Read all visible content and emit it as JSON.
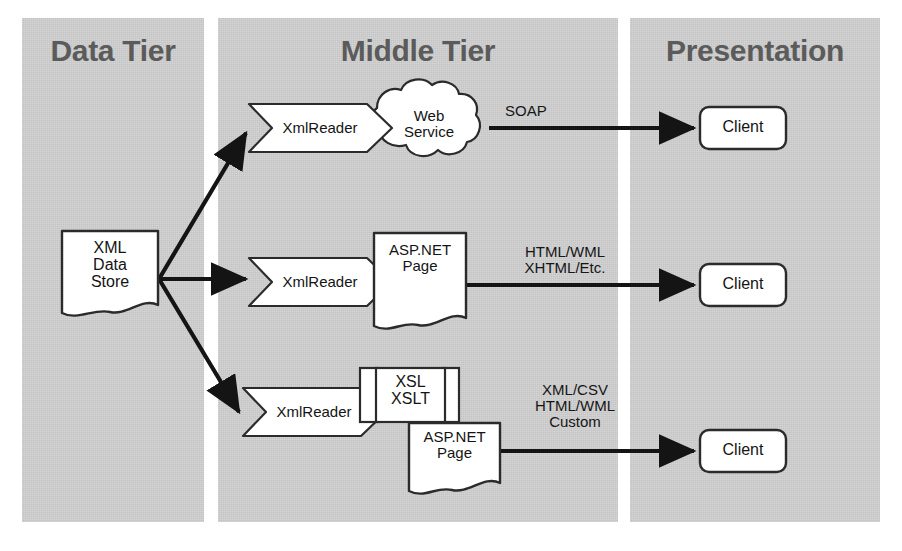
{
  "diagram": {
    "colors": {
      "panel_fill": "#c4c4c4",
      "panel_title_text": "#5b5b5b",
      "shape_fill": "#ffffff",
      "shape_stroke": "#2b2b2b",
      "arrow": "#141414",
      "page_background": "#ffffff"
    }
  },
  "tiers": [
    {
      "id": "data",
      "title": "Data Tier"
    },
    {
      "id": "middle",
      "title": "Middle Tier"
    },
    {
      "id": "presentation",
      "title": "Presentation"
    }
  ],
  "nodes": {
    "data_store": {
      "label": "XML\nData\nStore",
      "shape": "document"
    },
    "readers": [
      {
        "id": "reader-top",
        "label": "XmlReader",
        "shape": "hexagon-notched"
      },
      {
        "id": "reader-middle",
        "label": "XmlReader",
        "shape": "hexagon-notched"
      },
      {
        "id": "reader-bottom",
        "label": "XmlReader",
        "shape": "hexagon-notched"
      }
    ],
    "web_service": {
      "label": "Web\nService",
      "shape": "cloud"
    },
    "aspnet_page_top": {
      "label": "ASP.NET\nPage",
      "shape": "document"
    },
    "xsl_stack": {
      "label": "XSL\nXSLT",
      "shape": "multi-document"
    },
    "aspnet_page_bottom": {
      "label": "ASP.NET\nPage",
      "shape": "document"
    },
    "clients": [
      {
        "id": "client-top",
        "label": "Client",
        "shape": "rounded-rect"
      },
      {
        "id": "client-middle",
        "label": "Client",
        "shape": "rounded-rect"
      },
      {
        "id": "client-bottom",
        "label": "Client",
        "shape": "rounded-rect"
      }
    ]
  },
  "edge_labels": {
    "soap": "SOAP",
    "html_wml": "HTML/WML\nXHTML/Etc.",
    "xml_csv": "XML/CSV\nHTML/WML\nCustom"
  },
  "flows": [
    {
      "from": "XML Data Store",
      "to": "XmlReader (top)",
      "label": ""
    },
    {
      "from": "XML Data Store",
      "to": "XmlReader (middle)",
      "label": ""
    },
    {
      "from": "XML Data Store",
      "to": "XmlReader (bottom)",
      "label": ""
    },
    {
      "from": "Web Service",
      "to": "Client",
      "label": "SOAP"
    },
    {
      "from": "ASP.NET Page",
      "to": "Client",
      "label": "HTML/WML XHTML/Etc."
    },
    {
      "from": "ASP.NET Page",
      "to": "Client",
      "label": "XML/CSV HTML/WML Custom"
    }
  ]
}
